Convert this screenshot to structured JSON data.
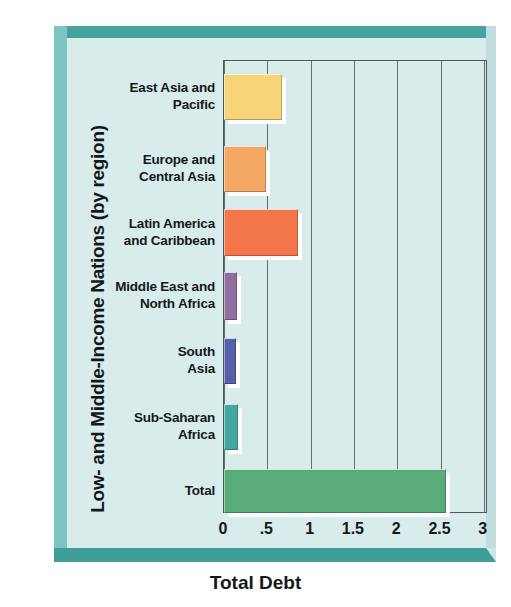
{
  "chart_data": {
    "type": "bar",
    "orientation": "horizontal",
    "title": "",
    "xlabel": "Total Debt",
    "ylabel": "Low- and Middle-Income Nations (by region)",
    "categories": [
      "East Asia and\nPacific",
      "Europe and\nCentral Asia",
      "Latin America\nand Caribbean",
      "Middle East and\nNorth Africa",
      "South\nAsia",
      "Sub-Saharan\nAfrica",
      "Total"
    ],
    "values": [
      0.67,
      0.48,
      0.85,
      0.15,
      0.14,
      0.16,
      2.56
    ],
    "bar_colors": [
      "#f7d479",
      "#f3a963",
      "#f4764b",
      "#8e6fa0",
      "#5560a8",
      "#45a8a0",
      "#59ab79"
    ],
    "xlim": [
      0,
      3
    ],
    "ticks": [
      0,
      0.5,
      1,
      1.5,
      2,
      2.5,
      3
    ],
    "tick_labels": [
      "0",
      ".5",
      "1",
      "1.5",
      "2",
      "2.5",
      "3"
    ],
    "grid": true,
    "grid_axis": "x",
    "legend": "none",
    "background_color": "#d8eceb",
    "frame_color": "#45a3a0"
  },
  "axes": {
    "x_title": "Total Debt",
    "y_title": "Low- and Middle-Income Nations (by region)"
  }
}
